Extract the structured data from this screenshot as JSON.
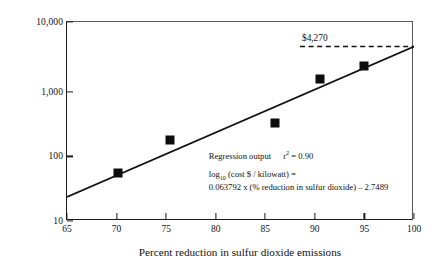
{
  "chart_data": {
    "type": "scatter",
    "title": "",
    "xlabel": "Percent reduction in sulfur dioxide emissions",
    "ylabel": "Capital cost ($/kilowatt)",
    "xlim": [
      65,
      100
    ],
    "ylim": [
      10,
      10000
    ],
    "yscale": "log10",
    "xscale": "linear",
    "grid": false,
    "legend": null,
    "xticks": [
      65,
      70,
      75,
      80,
      85,
      90,
      95,
      100
    ],
    "xticklabels": [
      "65",
      "70",
      "75",
      "80",
      "85",
      "90",
      "95",
      "100"
    ],
    "yticks": [
      10,
      100,
      1000,
      10000
    ],
    "yticklabels": [
      "10",
      "100",
      "1,000",
      "10,000"
    ],
    "x": [
      70.1,
      75.4,
      86.0,
      90.5,
      95.0
    ],
    "y": [
      53,
      165,
      300,
      1400,
      2200
    ],
    "points": [
      {
        "x": 70.1,
        "y": 53
      },
      {
        "x": 75.4,
        "y": 165
      },
      {
        "x": 86.0,
        "y": 300
      },
      {
        "x": 90.5,
        "y": 1400
      },
      {
        "x": 95.0,
        "y": 2200
      }
    ],
    "fit_line": {
      "type": "line",
      "slope": 0.063792,
      "intercept": -2.7489,
      "form": "log10(y) = 0.063792*x - 2.7489",
      "x_start": 65,
      "x_end": 100,
      "y_start": 23,
      "y_end": 4270
    },
    "annotations": [
      {
        "name": "reference-line-label",
        "text": "$4,270",
        "value": 4270,
        "style": "dashed-horizontal",
        "y": 4270,
        "x_start": 88.5,
        "x_end": 100
      }
    ],
    "regression": {
      "heading": "Regression output",
      "r2_label": "r",
      "r2_exponent": "2",
      "r2_equals": "= 0.90",
      "r2_value": 0.9,
      "equation_lhs_main": "log",
      "equation_lhs_sub": "10",
      "equation_lhs_rest": " (cost $ / kilowatt) =",
      "equation_rhs": "0.063792 x (% reduction in sulfur dioxide) – 2.7489"
    }
  },
  "colors": {
    "marker": "#0d0d0d",
    "line": "#111111",
    "axis": "#1a1a1a",
    "background": "#ffffff"
  }
}
